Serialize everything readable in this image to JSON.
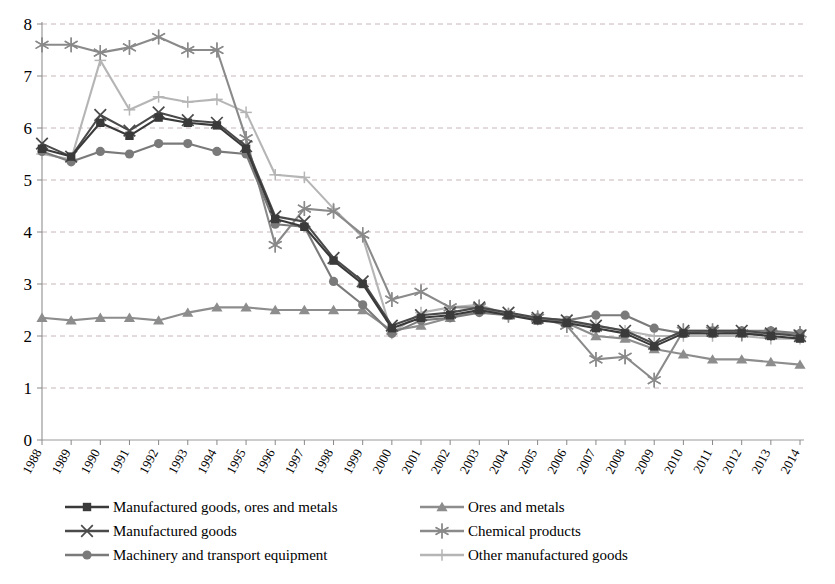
{
  "chart_data": {
    "type": "line",
    "title": "",
    "subtitle": "",
    "xlabel": "",
    "ylabel": "",
    "xlim": [
      1988,
      2014
    ],
    "ylim": [
      0,
      8
    ],
    "ytick_step": 1,
    "grid": true,
    "grid_axis": "y",
    "legend_position": "bottom",
    "legend_columns": 2,
    "categories": [
      "1988",
      "1989",
      "1990",
      "1991",
      "1992",
      "1993",
      "1994",
      "1995",
      "1996",
      "1997",
      "1998",
      "1999",
      "2000",
      "2001",
      "2002",
      "2003",
      "2004",
      "2005",
      "2006",
      "2007",
      "2008",
      "2009",
      "2010",
      "2011",
      "2012",
      "2013",
      "2014"
    ],
    "yticks": [
      "0",
      "1",
      "2",
      "3",
      "4",
      "5",
      "6",
      "7",
      "8"
    ],
    "series": [
      {
        "name": "Manufactured goods, ores and metals",
        "color": "#3a3a3a",
        "marker": "square",
        "values": [
          5.6,
          5.45,
          6.1,
          5.85,
          6.2,
          6.1,
          6.05,
          5.6,
          4.25,
          4.1,
          3.45,
          3.0,
          2.15,
          2.35,
          2.4,
          2.5,
          2.4,
          2.3,
          2.25,
          2.15,
          2.05,
          1.8,
          2.05,
          2.05,
          2.05,
          2.0,
          1.95
        ]
      },
      {
        "name": "Manufactured goods",
        "color": "#4a4a4a",
        "marker": "x",
        "values": [
          5.7,
          5.45,
          6.25,
          5.95,
          6.3,
          6.15,
          6.1,
          5.65,
          4.3,
          4.2,
          3.5,
          3.05,
          2.2,
          2.4,
          2.45,
          2.55,
          2.45,
          2.35,
          2.3,
          2.2,
          2.1,
          1.85,
          2.1,
          2.1,
          2.1,
          2.05,
          2.0
        ]
      },
      {
        "name": "Machinery and transport equipment",
        "color": "#7a7a7a",
        "marker": "circle",
        "values": [
          5.55,
          5.35,
          5.55,
          5.5,
          5.7,
          5.7,
          5.55,
          5.5,
          4.15,
          4.1,
          3.05,
          2.6,
          2.05,
          2.3,
          2.35,
          2.45,
          2.4,
          2.35,
          2.3,
          2.4,
          2.4,
          2.15,
          2.05,
          2.1,
          2.1,
          2.1,
          2.05
        ]
      },
      {
        "name": "Ores and metals",
        "color": "#8d8d8d",
        "marker": "triangle",
        "values": [
          2.35,
          2.3,
          2.35,
          2.35,
          2.3,
          2.45,
          2.55,
          2.55,
          2.5,
          2.5,
          2.5,
          2.5,
          2.1,
          2.2,
          2.35,
          2.5,
          2.4,
          2.35,
          2.25,
          2.0,
          1.95,
          1.75,
          1.65,
          1.55,
          1.55,
          1.5,
          1.45
        ]
      },
      {
        "name": "Chemical products",
        "color": "#8a8a8a",
        "marker": "asterisk",
        "values": [
          7.6,
          7.6,
          7.45,
          7.55,
          7.75,
          7.5,
          7.5,
          5.8,
          3.75,
          4.45,
          4.4,
          3.95,
          2.7,
          2.85,
          2.55,
          2.55,
          2.4,
          2.35,
          2.2,
          1.55,
          1.6,
          1.15,
          2.1,
          2.1,
          2.05,
          2.05,
          2.05
        ]
      },
      {
        "name": "Other manufactured goods",
        "color": "#b5b5b5",
        "marker": "plus",
        "values": [
          5.5,
          5.4,
          7.3,
          6.35,
          6.6,
          6.5,
          6.55,
          6.3,
          5.1,
          5.05,
          4.45,
          3.9,
          2.05,
          2.45,
          2.55,
          2.6,
          2.4,
          2.35,
          2.25,
          2.2,
          2.1,
          2.0,
          2.0,
          2.0,
          2.0,
          1.95,
          1.95
        ]
      }
    ]
  },
  "legend": {
    "items": [
      {
        "label": "Manufactured goods, ores and metals"
      },
      {
        "label": "Manufactured goods"
      },
      {
        "label": "Machinery and transport equipment"
      },
      {
        "label": "Ores and metals"
      },
      {
        "label": "Chemical products"
      },
      {
        "label": "Other manufactured goods"
      }
    ]
  }
}
